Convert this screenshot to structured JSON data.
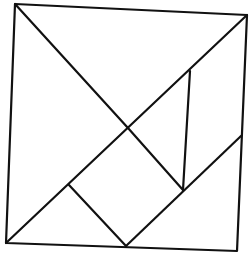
{
  "diagram": {
    "type": "tangram-square",
    "stroke_color": "#111111",
    "background": "#ffffff",
    "outer_square": {
      "points": [
        [
          15,
          4
        ],
        [
          247,
          15
        ],
        [
          237,
          251
        ],
        [
          6,
          243
        ]
      ]
    },
    "segments": [
      {
        "name": "main-diagonal-tl-to-center",
        "x1": 15,
        "y1": 4,
        "x2": 128,
        "y2": 128
      },
      {
        "name": "center-to-square-right",
        "x1": 128,
        "y1": 128,
        "x2": 183,
        "y2": 190
      },
      {
        "name": "anti-diagonal-bl-to-tr",
        "x1": 6,
        "y1": 243,
        "x2": 247,
        "y2": 15
      },
      {
        "name": "parallelogram-vertical",
        "x1": 190,
        "y1": 71,
        "x2": 183,
        "y2": 190
      },
      {
        "name": "lower-right-diagonal",
        "x1": 126,
        "y1": 246,
        "x2": 241,
        "y2": 136
      },
      {
        "name": "square-left-edge",
        "x1": 69,
        "y1": 185,
        "x2": 126,
        "y2": 246
      }
    ]
  }
}
